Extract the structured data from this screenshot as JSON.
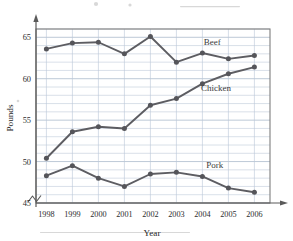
{
  "chart_data": {
    "type": "line",
    "title": "",
    "xlabel": "Year",
    "ylabel": "Pounds",
    "categories": [
      "1998",
      "1999",
      "2000",
      "2001",
      "2002",
      "2003",
      "2004",
      "2005",
      "2006"
    ],
    "x": [
      1998,
      1999,
      2000,
      2001,
      2002,
      2003,
      2004,
      2005,
      2006
    ],
    "xlim": [
      1997.6,
      2006.6
    ],
    "ylim": [
      45,
      66
    ],
    "y_ticks": [
      45,
      50,
      55,
      60,
      65
    ],
    "y_tick_labels": [
      "45",
      "50",
      "55",
      "60",
      "65"
    ],
    "y_minor_step": 1,
    "grid": true,
    "axis_break": true,
    "legend_position": "inline-labels",
    "series": [
      {
        "name": "Beef",
        "values": [
          63.6,
          64.3,
          64.4,
          63.0,
          65.1,
          62.0,
          63.1,
          62.4,
          62.8
        ],
        "label": "Beef",
        "label_x": 2004.05,
        "label_y": 64.05,
        "color": "#5d5d62"
      },
      {
        "name": "Chicken",
        "values": [
          50.4,
          53.6,
          54.2,
          54.0,
          56.8,
          57.6,
          59.4,
          60.6,
          61.4
        ],
        "label": "Chicken",
        "label_x": 2003.95,
        "label_y": 58.5,
        "color": "#5d5d62"
      },
      {
        "name": "Pork",
        "values": [
          48.3,
          49.5,
          48.0,
          47.0,
          48.5,
          48.7,
          48.2,
          46.8,
          46.3
        ],
        "label": "Pork",
        "label_x": 2004.15,
        "label_y": 49.25,
        "color": "#5d5d62"
      }
    ]
  },
  "axes": {
    "x_title": "Year",
    "y_title": "Pounds"
  }
}
